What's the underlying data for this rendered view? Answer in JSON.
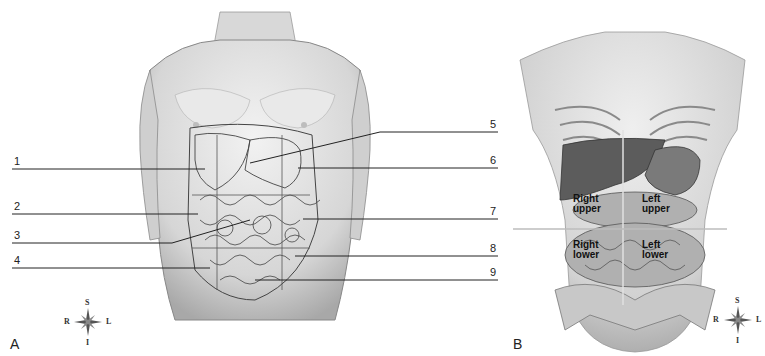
{
  "panel_a": {
    "letter": "A",
    "labels_left": [
      "1",
      "2",
      "3",
      "4"
    ],
    "labels_right": [
      "5",
      "6",
      "7",
      "8",
      "9"
    ],
    "compass": {
      "superior": "S",
      "inferior": "I",
      "right": "R",
      "left": "L"
    }
  },
  "panel_b": {
    "letter": "B",
    "quadrants": {
      "right_upper": [
        "Right",
        "upper"
      ],
      "left_upper": [
        "Left",
        "upper"
      ],
      "right_lower": [
        "Right",
        "lower"
      ],
      "left_lower": [
        "Left",
        "lower"
      ]
    },
    "compass": {
      "superior": "S",
      "inferior": "I",
      "right": "R",
      "left": "L"
    }
  },
  "colors": {
    "skin_light": "#e8e8e8",
    "skin_shadow": "#b5b5b5",
    "outline": "#555555",
    "organ_dark": "#5a5a5a",
    "organ_mid": "#9a9a9a",
    "leader_line": "#222222"
  }
}
